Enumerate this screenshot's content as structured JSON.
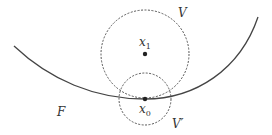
{
  "diagram": {
    "labels": {
      "V": "V",
      "V_prime": "V′",
      "F": "F",
      "x1_base": "x",
      "x1_sub": "1",
      "x0_base": "x",
      "x0_sub": "0"
    },
    "colors": {
      "curve": "#444444",
      "circles": "#555555",
      "points": "#222222",
      "text": "#333333"
    },
    "elements": {
      "curve_F": {
        "from": [
          14,
          46
        ],
        "through": [
          145,
          99
        ],
        "to": [
          258,
          17
        ]
      },
      "circle_V": {
        "center": [
          145,
          54
        ],
        "radius": 44,
        "style": "dashed"
      },
      "circle_V_prime": {
        "center": [
          145,
          99
        ],
        "radius": 26,
        "style": "dashed"
      },
      "point_x1": [
        145,
        54
      ],
      "point_x0": [
        145,
        99
      ]
    }
  }
}
